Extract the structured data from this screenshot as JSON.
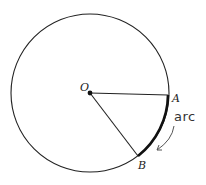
{
  "diagram": {
    "type": "circle-arc",
    "labels": {
      "center": "O",
      "point_a": "A",
      "point_b": "B",
      "annotation": "arc"
    },
    "elements": [
      {
        "name": "circle",
        "description": "circle centered at O"
      },
      {
        "name": "radius-oa",
        "description": "radius from O to A"
      },
      {
        "name": "radius-ob",
        "description": "radius from O to B"
      },
      {
        "name": "arc-ab",
        "description": "highlighted arc from A to B"
      },
      {
        "name": "arc-arrow",
        "description": "hand-drawn arrow pointing to arc"
      }
    ],
    "colors": {
      "stroke": "#222222",
      "background": "#ffffff"
    }
  }
}
